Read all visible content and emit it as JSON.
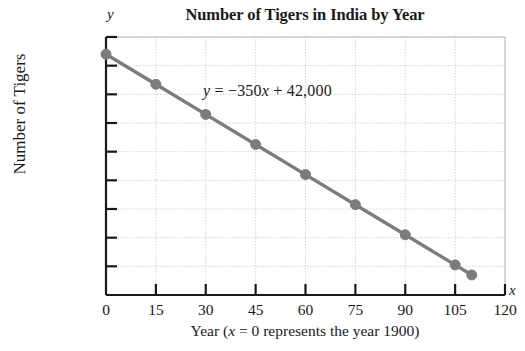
{
  "chart_data": {
    "type": "line",
    "title": "Number of Tigers in India by Year",
    "xlabel": "Year (x = 0 represents the year 1900)",
    "ylabel": "Number of Tigers",
    "x_axis_letter": "y",
    "y_axis_letter": "y",
    "axis_letter_x": "x",
    "axis_letter_y": "y",
    "annotation": "y = −350x + 42,000",
    "annotation_parts": {
      "var_y": "y",
      "equals": " = −350",
      "var_x": "x",
      "tail": " + 42,000"
    },
    "xlim": [
      0,
      120
    ],
    "ylim": [
      0,
      45000
    ],
    "x_ticks": [
      0,
      15,
      30,
      45,
      60,
      75,
      90,
      105,
      120
    ],
    "x_tick_labels": [
      "0",
      "15",
      "30",
      "45",
      "60",
      "75",
      "90",
      "105",
      "120"
    ],
    "y_ticks": [
      0,
      5000,
      10000,
      15000,
      20000,
      25000,
      30000,
      35000,
      40000,
      45000
    ],
    "y_tick_labels": [
      "0",
      "5,000",
      "10,000",
      "15,000",
      "20,000",
      "25,000",
      "30,000",
      "35,000",
      "40,000",
      "45,000"
    ],
    "grid": true,
    "legend": null,
    "series": [
      {
        "name": "Number of Tigers",
        "color": "#7c7c7c",
        "marker": "circle",
        "x": [
          0,
          15,
          30,
          45,
          60,
          75,
          90,
          105,
          110
        ],
        "values": [
          42000,
          36750,
          31500,
          26250,
          21000,
          15750,
          10500,
          5250,
          3500
        ]
      }
    ],
    "colors": {
      "line": "#7c7c7c",
      "marker": "#7c7c7c",
      "axis": "#1a1a1a",
      "grid": "#c9c9c9",
      "background": "#ffffff",
      "text": "#1a1a1a"
    }
  }
}
